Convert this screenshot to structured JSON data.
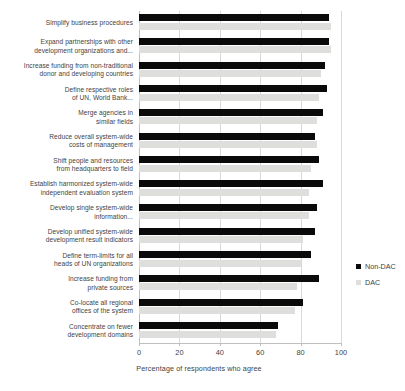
{
  "chart_data": {
    "type": "bar",
    "orientation": "horizontal",
    "title": "",
    "xlabel": "Percentage of respondents who agree",
    "ylabel": "",
    "xlim": [
      0,
      110
    ],
    "xticks": [
      0,
      20,
      40,
      60,
      80,
      100
    ],
    "grid": true,
    "legend_position": "right",
    "categories": [
      "Simplify business procedures",
      "Expand partnerships with other development organizations and...",
      "Increase funding from non-traditional donor and developing countries",
      "Define respective roles of UN, World Bank...",
      "Merge agencies in similar fields",
      "Reduce overall system-wide costs of management",
      "Shift people and resources from headquarters to field",
      "Establish harmonized system-wide independent evaluation system",
      "Develop single system-wide information...",
      "Develop unified system-wide development result indicators",
      "Define term-limits for all heads of UN organizations",
      "Increase funding from private sources",
      "Co-locate all regional offices of the system",
      "Concentrate on fewer development domains"
    ],
    "category_lines": [
      [
        "Simplify business procedures"
      ],
      [
        "Expand partnerships with other",
        "development organizations and..."
      ],
      [
        "Increase funding from non-traditional",
        "donor and developing countries"
      ],
      [
        "Define respective roles",
        "of UN, World Bank..."
      ],
      [
        "Merge agencies in",
        "similar fields"
      ],
      [
        "Reduce overall system-wide",
        "costs of management"
      ],
      [
        "Shift people and resources",
        "from headquarters to field"
      ],
      [
        "Establish harmonized system-wide",
        "independent evaluation system"
      ],
      [
        "Develop single system-wide",
        "information..."
      ],
      [
        "Develop unified system-wide",
        "development result indicators"
      ],
      [
        "Define term-limits for all",
        "heads of UN organizations"
      ],
      [
        "Increase funding from",
        "private sources"
      ],
      [
        "Co-locate all regional",
        "offices of the system"
      ],
      [
        "Concentrate on fewer",
        "development domains"
      ]
    ],
    "series": [
      {
        "name": "Non-DAC",
        "color": "#0a0a0a",
        "values": [
          94,
          94,
          92,
          93,
          91,
          87,
          89,
          91,
          88,
          87,
          85,
          89,
          81,
          69
        ]
      },
      {
        "name": "DAC",
        "color": "#dededc",
        "values": [
          95,
          95,
          90,
          89,
          88,
          88,
          85,
          84,
          84,
          81,
          80,
          78,
          77,
          68
        ]
      }
    ]
  },
  "legend": {
    "items": [
      {
        "label": "Non-DAC",
        "swatch": "legend-swatch-nondac"
      },
      {
        "label": "DAC",
        "swatch": "legend-swatch-dac"
      }
    ]
  },
  "axis": {
    "x_title": "Percentage of respondents who agree",
    "tick_labels": [
      "0",
      "20",
      "40",
      "60",
      "80",
      "100"
    ]
  }
}
